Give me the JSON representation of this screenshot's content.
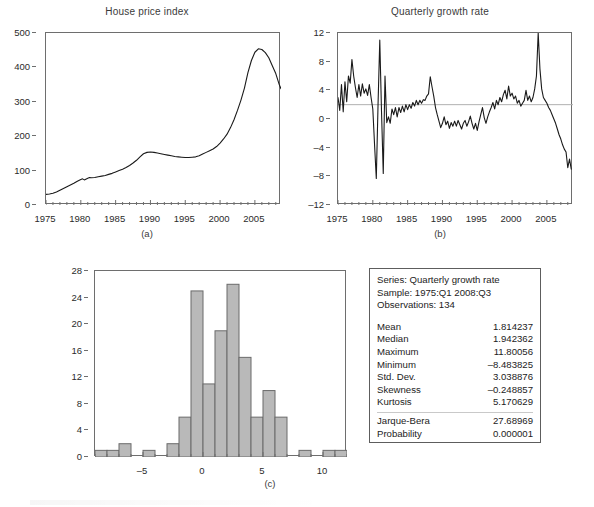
{
  "figure": {
    "panels": [
      {
        "caption": "(a)",
        "title": "House price index"
      },
      {
        "caption": "(b)",
        "title": "Quarterly growth rate"
      },
      {
        "caption": "(c)",
        "title": ""
      }
    ],
    "colors": {
      "line": "#1a1a1a",
      "bar_fill": "#b9b9b9",
      "bar_stroke": "#6b6b6b",
      "frame": "#6e6e6e",
      "reference_line": "#b0b0b0"
    }
  },
  "stats": {
    "header": {
      "series_label": "Series: Quarterly growth rate",
      "sample_label": "Sample: 1975:Q1 2008:Q3",
      "observations_label": "Observations: 134"
    },
    "rows": [
      {
        "key": "Mean",
        "value": "1.814237"
      },
      {
        "key": "Median",
        "value": "1.942362"
      },
      {
        "key": "Maximum",
        "value": "11.80056"
      },
      {
        "key": "Minimum",
        "value": "–8.483825"
      },
      {
        "key": "Std. Dev.",
        "value": "3.038876"
      },
      {
        "key": "Skewness",
        "value": "–0.248857"
      },
      {
        "key": "Kurtosis",
        "value": "5.170629"
      }
    ],
    "test_rows": [
      {
        "key": "Jarque-Bera",
        "value": "27.68969"
      },
      {
        "key": "Probability",
        "value": "0.000001"
      }
    ]
  },
  "chart_data": [
    {
      "id": "panel-a",
      "type": "line",
      "title": "House price index",
      "caption": "(a)",
      "xlabel": "",
      "ylabel": "",
      "xlim": [
        1975,
        2008.75
      ],
      "ylim": [
        0,
        500
      ],
      "yticks": [
        0,
        100,
        200,
        300,
        400,
        500
      ],
      "xticks": [
        1975,
        1980,
        1985,
        1990,
        1995,
        2000,
        2005
      ],
      "xminor_step": 1,
      "grid": false,
      "legend": "none",
      "x": [
        1975.0,
        1975.5,
        1976.0,
        1976.5,
        1977.0,
        1977.5,
        1978.0,
        1978.5,
        1979.0,
        1979.5,
        1980.0,
        1980.25,
        1980.5,
        1981.0,
        1981.25,
        1981.5,
        1982.0,
        1982.5,
        1983.0,
        1983.5,
        1984.0,
        1984.5,
        1985.0,
        1985.5,
        1986.0,
        1986.5,
        1987.0,
        1987.5,
        1988.0,
        1988.5,
        1989.0,
        1989.5,
        1990.0,
        1990.5,
        1991.0,
        1991.5,
        1992.0,
        1992.5,
        1993.0,
        1993.5,
        1994.0,
        1994.5,
        1995.0,
        1995.5,
        1996.0,
        1996.5,
        1997.0,
        1997.5,
        1998.0,
        1998.5,
        1999.0,
        1999.5,
        2000.0,
        2000.5,
        2001.0,
        2001.5,
        2002.0,
        2002.5,
        2003.0,
        2003.5,
        2004.0,
        2004.5,
        2005.0,
        2005.5,
        2006.0,
        2006.5,
        2007.0,
        2007.5,
        2008.0,
        2008.5,
        2008.75
      ],
      "y": [
        31,
        32,
        34,
        38,
        43,
        48,
        53,
        58,
        63,
        69,
        74,
        76,
        73,
        78,
        80,
        79,
        80,
        82,
        84,
        86,
        89,
        92,
        96,
        100,
        104,
        109,
        115,
        122,
        130,
        140,
        149,
        153,
        154,
        153,
        151,
        149,
        147,
        145,
        143,
        141,
        140,
        139,
        138,
        138,
        139,
        140,
        143,
        148,
        153,
        158,
        163,
        170,
        180,
        192,
        206,
        225,
        248,
        275,
        305,
        340,
        385,
        420,
        444,
        454,
        452,
        443,
        428,
        405,
        382,
        350,
        338
      ]
    },
    {
      "id": "panel-b",
      "type": "line",
      "title": "Quarterly growth rate",
      "caption": "(b)",
      "xlabel": "",
      "ylabel": "",
      "xlim": [
        1975,
        2008.75
      ],
      "ylim": [
        -12,
        12
      ],
      "yticks": [
        -12,
        -8,
        -4,
        0,
        4,
        8,
        12
      ],
      "xticks": [
        1975,
        1980,
        1985,
        1990,
        1995,
        2000,
        2005
      ],
      "xminor_step": 1,
      "grid": false,
      "reference_line_y": 2.0,
      "legend": "none",
      "x": [
        1975.0,
        1975.25,
        1975.5,
        1975.75,
        1976.0,
        1976.25,
        1976.5,
        1976.75,
        1977.0,
        1977.25,
        1977.5,
        1977.75,
        1978.0,
        1978.25,
        1978.5,
        1978.75,
        1979.0,
        1979.25,
        1979.5,
        1979.75,
        1980.0,
        1980.25,
        1980.5,
        1980.75,
        1981.0,
        1981.25,
        1981.5,
        1981.75,
        1982.0,
        1982.25,
        1982.5,
        1982.75,
        1983.0,
        1983.25,
        1983.5,
        1983.75,
        1984.0,
        1984.25,
        1984.5,
        1984.75,
        1985.0,
        1985.25,
        1985.5,
        1985.75,
        1986.0,
        1986.25,
        1986.5,
        1986.75,
        1987.0,
        1987.25,
        1987.5,
        1987.75,
        1988.0,
        1988.25,
        1988.5,
        1988.75,
        1989.0,
        1989.25,
        1989.5,
        1989.75,
        1990.0,
        1990.25,
        1990.5,
        1990.75,
        1991.0,
        1991.25,
        1991.5,
        1991.75,
        1992.0,
        1992.25,
        1992.5,
        1992.75,
        1993.0,
        1993.25,
        1993.5,
        1993.75,
        1994.0,
        1994.25,
        1994.5,
        1994.75,
        1995.0,
        1995.25,
        1995.5,
        1995.75,
        1996.0,
        1996.25,
        1996.5,
        1996.75,
        1997.0,
        1997.25,
        1997.5,
        1997.75,
        1998.0,
        1998.25,
        1998.5,
        1998.75,
        1999.0,
        1999.25,
        1999.5,
        1999.75,
        2000.0,
        2000.25,
        2000.5,
        2000.75,
        2001.0,
        2001.25,
        2001.5,
        2001.75,
        2002.0,
        2002.25,
        2002.5,
        2002.75,
        2003.0,
        2003.25,
        2003.5,
        2003.75,
        2004.0,
        2004.25,
        2004.5,
        2004.75,
        2005.0,
        2005.25,
        2005.5,
        2005.75,
        2006.0,
        2006.25,
        2006.5,
        2006.75,
        2007.0,
        2007.25,
        2007.5,
        2007.75,
        2008.0,
        2008.25,
        2008.5
      ],
      "y": [
        3.0,
        1.2,
        4.8,
        1.0,
        5.2,
        2.4,
        6.0,
        5.0,
        8.3,
        6.0,
        4.4,
        3.0,
        4.8,
        3.2,
        4.9,
        3.6,
        4.2,
        3.3,
        4.8,
        3.0,
        1.4,
        -3.6,
        -8.3,
        2.0,
        11.0,
        1.0,
        -7.6,
        6.0,
        -0.5,
        0.3,
        -0.6,
        1.4,
        0.6,
        1.6,
        0.3,
        1.6,
        0.9,
        1.8,
        1.0,
        2.0,
        1.3,
        2.0,
        1.5,
        2.3,
        1.8,
        2.6,
        2.0,
        2.6,
        2.2,
        2.7,
        2.6,
        3.2,
        3.5,
        5.9,
        4.5,
        3.2,
        1.6,
        0.6,
        -0.3,
        -1.2,
        -0.6,
        0.3,
        -0.8,
        -0.3,
        -1.3,
        -0.5,
        -1.0,
        -0.3,
        -1.0,
        -0.2,
        -0.8,
        -1.4,
        -0.6,
        -0.2,
        -1.0,
        -0.4,
        0.4,
        -0.6,
        -1.4,
        -0.6,
        -1.6,
        -0.4,
        0.6,
        1.6,
        0.2,
        -0.6,
        0.3,
        1.0,
        1.6,
        2.3,
        1.4,
        2.6,
        2.0,
        3.0,
        2.4,
        3.4,
        4.0,
        2.8,
        4.6,
        3.2,
        3.6,
        2.8,
        3.2,
        2.2,
        2.6,
        1.8,
        2.2,
        2.6,
        4.0,
        2.6,
        3.2,
        2.4,
        3.0,
        4.2,
        6.0,
        12.0,
        7.0,
        4.2,
        3.0,
        2.6,
        2.2,
        1.6,
        1.2,
        0.6,
        0.0,
        -0.6,
        -1.4,
        -2.2,
        -2.8,
        -3.6,
        -4.2,
        -4.6,
        -6.8,
        -5.6,
        -7.0
      ]
    },
    {
      "id": "panel-c",
      "type": "bar",
      "subtype": "histogram",
      "title": "",
      "caption": "(c)",
      "xlabel": "",
      "ylabel": "",
      "xlim": [
        -9,
        12
      ],
      "ylim": [
        0,
        28
      ],
      "yticks": [
        0,
        4,
        8,
        12,
        16,
        20,
        24,
        28
      ],
      "xticks": [
        -5,
        0,
        5,
        10
      ],
      "xminor_step": 1,
      "grid": false,
      "legend": "none",
      "bin_width": 1,
      "bin_starts": [
        -9,
        -8,
        -7,
        -6,
        -5,
        -4,
        -3,
        -2,
        -1,
        0,
        1,
        2,
        3,
        4,
        5,
        6,
        7,
        8,
        9,
        10,
        11
      ],
      "categories": [
        "-9",
        "-8",
        "-7",
        "-6",
        "-5",
        "-4",
        "-3",
        "-2",
        "-1",
        "0",
        "1",
        "2",
        "3",
        "4",
        "5",
        "6",
        "7",
        "8",
        "9",
        "10",
        "11"
      ],
      "values": [
        1,
        1,
        2,
        0,
        1,
        0,
        2,
        6,
        25,
        11,
        19,
        26,
        15,
        6,
        10,
        6,
        0,
        1,
        0,
        1,
        1
      ]
    }
  ]
}
